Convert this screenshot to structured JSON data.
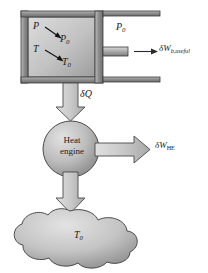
{
  "figure": {
    "background_color": "#ffffff"
  },
  "cylinder": {
    "name": "piston-cylinder-device",
    "wall_color": "#8c8c8c",
    "gas_fill_light": "#d6d6d6",
    "gas_fill_dark": "#9a9a9a",
    "state_labels": {
      "pressure_initial": "P",
      "pressure_final": "P",
      "pressure_final_sub": "0",
      "temperature_initial": "T",
      "temperature_final": "T",
      "temperature_final_sub": "0"
    }
  },
  "ambient": {
    "pressure_label": "P",
    "pressure_sub": "0"
  },
  "boundary_work": {
    "label": "δW",
    "subscript": "b,useful"
  },
  "heat_transfer": {
    "label": "δQ"
  },
  "heat_engine": {
    "line1": "Heat",
    "line2": "engine",
    "fill_light": "#cfcfcf",
    "fill_dark": "#8f8f8f"
  },
  "engine_work": {
    "label": "δW",
    "subscript": "HE"
  },
  "surroundings": {
    "name": "surroundings-reservoir",
    "temperature_label": "T",
    "temperature_sub": "0",
    "fill_light": "#d2d2d2",
    "fill_dark": "#8a8a8a"
  },
  "arrow_color": "#bfbfbf",
  "outline_color": "#3a3a3a"
}
